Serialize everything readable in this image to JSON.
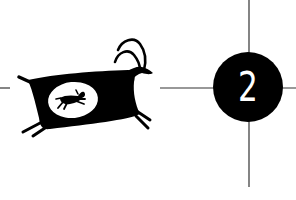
{
  "illustration": {
    "figure": "petroglyph-goat",
    "inner_figure": "small-running-animal",
    "badge": {
      "number": "2",
      "fill_color": "#000000",
      "text_color": "#ffffff"
    },
    "crosshair": {
      "line_color": "#333333"
    },
    "background_color": "#ffffff"
  }
}
